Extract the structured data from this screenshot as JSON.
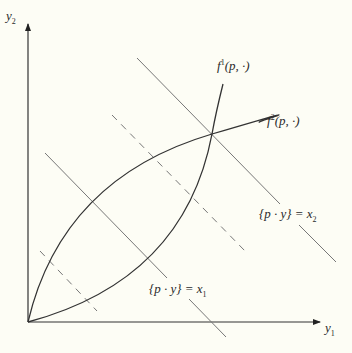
{
  "diagram": {
    "axes": {
      "x_label": "y",
      "x_label_sub": "1",
      "y_label": "y",
      "y_label_sub": "2"
    },
    "curves": [
      {
        "name": "f1",
        "label_base": "f",
        "label_sup": "1",
        "label_args": "(p, ·)"
      },
      {
        "name": "f2",
        "label_base": "f",
        "label_sup": "2",
        "label_args": "(p, ·)"
      }
    ],
    "isoprofit_lines": [
      {
        "name": "x1",
        "label": "{p · y} = x",
        "label_sub": "1",
        "style": "solid"
      },
      {
        "name": "x2",
        "label": "{p · y} = x",
        "label_sub": "2",
        "style": "solid"
      },
      {
        "name": "lower-dashed",
        "style": "dashed"
      },
      {
        "name": "upper-dashed",
        "style": "dashed"
      }
    ],
    "colors": {
      "background": "#fdfdf5",
      "axis": "#333333",
      "curve": "#333333",
      "line": "#666666"
    }
  }
}
